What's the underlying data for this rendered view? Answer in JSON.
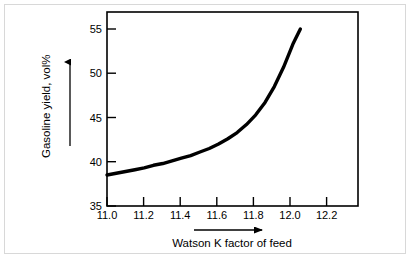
{
  "figure": {
    "background_color": "#ffffff",
    "frame_color": "#d8d8d8",
    "line_color": "#000000"
  },
  "chart_data": {
    "type": "line",
    "title": "",
    "xlabel": "Watson K factor of feed",
    "ylabel": "Gasoline yield, vol%",
    "xlim": [
      11.0,
      12.35
    ],
    "ylim": [
      35,
      55.8
    ],
    "grid": false,
    "legend": "none",
    "xticks": [
      "11.0",
      "11.2",
      "11.4",
      "11.6",
      "11.8",
      "12.0",
      "12.2"
    ],
    "xtick_values": [
      11.0,
      11.2,
      11.4,
      11.6,
      11.8,
      12.0,
      12.2
    ],
    "yticks": [
      "35",
      "40",
      "45",
      "50",
      "55"
    ],
    "ytick_values": [
      35,
      40,
      45,
      50,
      55
    ],
    "x": [
      11.0,
      11.05,
      11.1,
      11.15,
      11.2,
      11.25,
      11.3,
      11.35,
      11.4,
      11.45,
      11.5,
      11.55,
      11.6,
      11.65,
      11.7,
      11.75,
      11.8,
      11.85,
      11.9,
      11.95,
      12.0,
      12.04
    ],
    "values": [
      38.5,
      38.7,
      38.9,
      39.1,
      39.3,
      39.6,
      39.8,
      40.1,
      40.4,
      40.7,
      41.1,
      41.5,
      42.0,
      42.6,
      43.3,
      44.2,
      45.3,
      46.7,
      48.5,
      50.7,
      53.3,
      55.0
    ],
    "series": [
      {
        "name": "Gasoline yield",
        "values": [
          38.5,
          38.7,
          38.9,
          39.1,
          39.3,
          39.6,
          39.8,
          40.1,
          40.4,
          40.7,
          41.1,
          41.5,
          42.0,
          42.6,
          43.3,
          44.2,
          45.3,
          46.7,
          48.5,
          50.7,
          53.3,
          55.0
        ]
      }
    ],
    "annotations": [
      {
        "name": "y-axis-direction-arrow",
        "direction": "up"
      },
      {
        "name": "x-axis-direction-arrow",
        "direction": "right"
      }
    ]
  }
}
